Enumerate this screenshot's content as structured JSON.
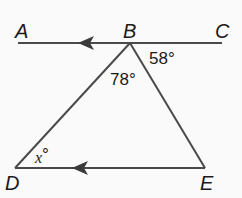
{
  "diagram": {
    "points": {
      "A": "A",
      "B": "B",
      "C": "C",
      "D": "D",
      "E": "E"
    },
    "angles": {
      "cbe": "58°",
      "dbe": "78°",
      "bde_main": "x",
      "bde_deg": "°"
    },
    "colors": {
      "line": "#4a4a4a",
      "text": "#1a1a1a",
      "background": "#ffffff"
    }
  }
}
